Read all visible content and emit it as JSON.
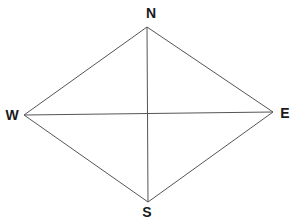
{
  "diagram": {
    "type": "rhombus-compass",
    "background_color": "#ffffff",
    "line_color": "#555555",
    "line_width": 1,
    "label_color": "#1a1a1a",
    "vertices": {
      "N": {
        "label": "N",
        "x": 147,
        "y": 27,
        "label_x": 151,
        "label_y": 13
      },
      "E": {
        "label": "E",
        "x": 273,
        "y": 112,
        "label_x": 285,
        "label_y": 113
      },
      "S": {
        "label": "S",
        "x": 148,
        "y": 202,
        "label_x": 147,
        "label_y": 212
      },
      "W": {
        "label": "W",
        "x": 24,
        "y": 115,
        "label_x": 12,
        "label_y": 115
      }
    },
    "edges": [
      [
        "N",
        "E"
      ],
      [
        "E",
        "S"
      ],
      [
        "S",
        "W"
      ],
      [
        "W",
        "N"
      ]
    ],
    "diagonals": [
      [
        "N",
        "S"
      ],
      [
        "W",
        "E"
      ]
    ]
  }
}
